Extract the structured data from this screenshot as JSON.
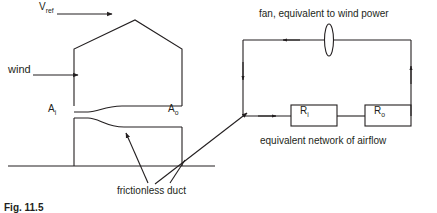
{
  "figure": {
    "caption": "Fig. 11.5",
    "building": {
      "vref_label": "V",
      "vref_sub": "ref",
      "wind_label": "wind",
      "inlet_label": "A",
      "inlet_sub": "i",
      "outlet_label": "A",
      "outlet_sub": "o",
      "duct_label": "frictionless duct"
    },
    "network": {
      "fan_label": "fan, equivalent to wind power",
      "resistor_inlet_label": "R",
      "resistor_inlet_sub": "i",
      "resistor_outlet_label": "R",
      "resistor_outlet_sub": "o",
      "caption": "equivalent network of airflow"
    },
    "colors": {
      "line": "#231f20",
      "text": "#231f20",
      "background": "#ffffff"
    }
  }
}
